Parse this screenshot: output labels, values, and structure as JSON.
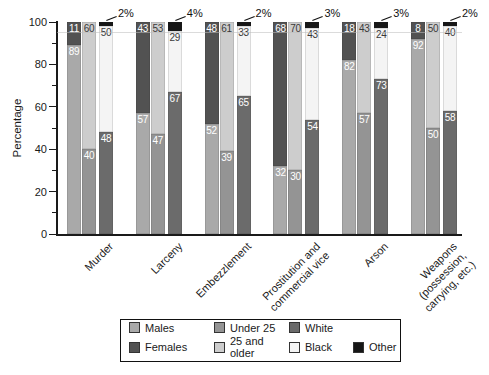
{
  "chart_data": {
    "type": "bar",
    "variant": "grouped-stacked-percentage",
    "title": "",
    "xlabel": "",
    "ylabel": "Percentage",
    "ylim": [
      0,
      100
    ],
    "yticks_major": [
      0,
      20,
      40,
      60,
      80,
      100
    ],
    "yticks_minor": [
      10,
      30,
      50,
      70,
      90
    ],
    "grid": "off",
    "legend_position": "bottom",
    "categories": [
      "Murder",
      "Larceny",
      "Embezzlement",
      "Prostitution and commercial vice",
      "Arson",
      "Weapons (possession, carrying, etc.)"
    ],
    "category_label_lines": [
      [
        "Murder"
      ],
      [
        "Larceny"
      ],
      [
        "Embezzlement"
      ],
      [
        "Prostitution and",
        "commercial vice"
      ],
      [
        "Arson"
      ],
      [
        "Weapons",
        "(possession,",
        "carrying, etc.)"
      ]
    ],
    "bars": [
      {
        "name": "sex",
        "segments": [
          {
            "label": "Males",
            "color": "males",
            "values": [
              89,
              57,
              52,
              32,
              82,
              92
            ]
          },
          {
            "label": "Females",
            "color": "females",
            "values": [
              11,
              43,
              48,
              68,
              18,
              8
            ]
          }
        ]
      },
      {
        "name": "age",
        "segments": [
          {
            "label": "Under 25",
            "color": "under25",
            "values": [
              40,
              47,
              39,
              30,
              57,
              50
            ]
          },
          {
            "label": "25 and older",
            "color": "older25",
            "values": [
              60,
              53,
              61,
              70,
              43,
              50
            ]
          }
        ]
      },
      {
        "name": "race",
        "segments": [
          {
            "label": "White",
            "color": "white",
            "values": [
              48,
              67,
              65,
              54,
              73,
              58
            ]
          },
          {
            "label": "Black",
            "color": "black",
            "values": [
              50,
              29,
              33,
              43,
              24,
              40
            ]
          },
          {
            "label": "Other",
            "color": "other",
            "values": [
              2,
              4,
              2,
              3,
              3,
              2
            ],
            "label_outside": true
          }
        ]
      }
    ],
    "outside_labels": [
      "2%",
      "4%",
      "2%",
      "3%",
      "3%",
      "2%"
    ],
    "legend": {
      "rows": [
        [
          {
            "label": "Males",
            "color": "males"
          },
          {
            "label": "Under 25",
            "color": "under25"
          },
          {
            "label": "White",
            "color": "white"
          },
          null
        ],
        [
          {
            "label": "Females",
            "color": "females"
          },
          {
            "label": "25 and older",
            "color": "older25"
          },
          {
            "label": "Black",
            "color": "black"
          },
          {
            "label": "Other",
            "color": "other"
          }
        ]
      ]
    },
    "colors": {
      "males": "#a9a9a9",
      "females": "#525252",
      "under25": "#949494",
      "older25": "#cdcdcd",
      "white": "#6b6b6b",
      "black": "#f4f4f4",
      "other": "#161616",
      "axis": "#1a1a1a"
    }
  }
}
